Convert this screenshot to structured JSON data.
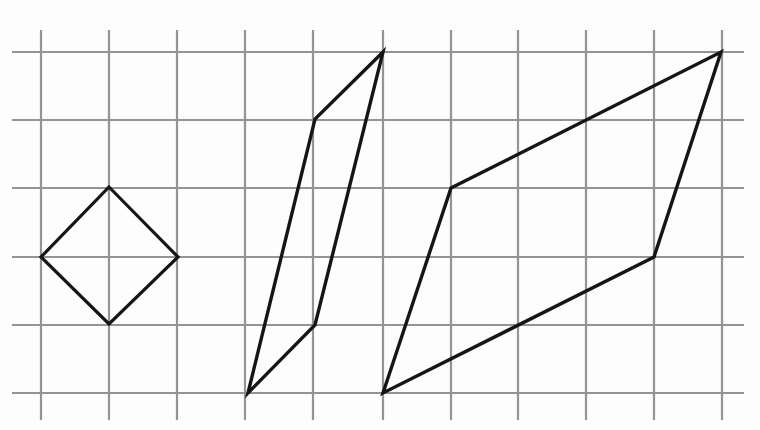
{
  "figure": {
    "canvas": {
      "width": 760,
      "height": 430,
      "background": "#fdfdfd"
    },
    "grid": {
      "name": "square-grid",
      "color": "#949494",
      "stroke_width": 2.2,
      "cell_size": 68,
      "vertical_x": [
        41,
        109,
        177,
        245,
        313,
        383,
        451,
        518,
        586,
        654,
        722
      ],
      "horizontal_y": [
        52,
        120,
        188,
        257,
        325,
        393
      ],
      "vertical_span": [
        30,
        420
      ],
      "horizontal_span": [
        12,
        744
      ]
    },
    "shapes": [
      {
        "name": "rhombus-diamond",
        "label": "diamond",
        "color": "#151515",
        "stroke_width": 3.2,
        "points": [
          [
            41,
            188
          ],
          [
            109,
            187
          ],
          [
            178,
            257
          ],
          [
            109,
            324
          ]
        ],
        "points_ordered": [
          [
            109,
            187
          ],
          [
            178,
            257
          ],
          [
            109,
            324
          ],
          [
            41,
            257
          ]
        ]
      },
      {
        "name": "narrow-parallelogram",
        "label": "thin slanted parallelogram",
        "color": "#151515",
        "stroke_width": 3.4,
        "points_ordered": [
          [
            248,
            393
          ],
          [
            315,
            119
          ],
          [
            383,
            52
          ],
          [
            315,
            325
          ]
        ]
      },
      {
        "name": "wide-parallelogram",
        "label": "wide slanted parallelogram",
        "color": "#151515",
        "stroke_width": 3.4,
        "points_ordered": [
          [
            383,
            393
          ],
          [
            451,
            188
          ],
          [
            721,
            52
          ],
          [
            654,
            257
          ]
        ]
      }
    ]
  },
  "chart_data": {
    "type": "scatter",
    "xlabel": "",
    "ylabel": "",
    "xlim": [
      0,
      10
    ],
    "ylim": [
      0,
      5
    ],
    "grid": true,
    "legend": "none",
    "series": [
      {
        "name": "diamond",
        "x": [
          1,
          2,
          1,
          0,
          1
        ],
        "y": [
          4,
          3,
          2,
          3,
          4
        ]
      },
      {
        "name": "narrow-parallelogram",
        "x": [
          3,
          4,
          5,
          4,
          3
        ],
        "y": [
          0,
          4,
          5,
          1,
          0
        ]
      },
      {
        "name": "wide-parallelogram",
        "x": [
          5,
          6,
          10,
          9,
          5
        ],
        "y": [
          0,
          3,
          5,
          2,
          0
        ]
      }
    ]
  }
}
